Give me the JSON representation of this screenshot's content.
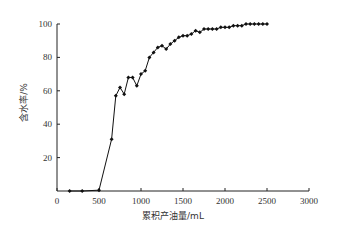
{
  "chart_data": {
    "type": "line",
    "title": "",
    "xlabel": "累积产油量/mL",
    "ylabel": "含水率/%",
    "xlim": [
      0,
      3000
    ],
    "ylim": [
      0,
      100
    ],
    "xticks": [
      0,
      500,
      1000,
      1500,
      2000,
      2500,
      3000
    ],
    "yticks": [
      20,
      40,
      60,
      80,
      100
    ],
    "grid": false,
    "legend": null,
    "marker": "diamond",
    "series": [
      {
        "name": "含水率",
        "x": [
          150,
          300,
          500,
          650,
          700,
          750,
          800,
          850,
          900,
          950,
          1000,
          1050,
          1100,
          1150,
          1200,
          1250,
          1300,
          1350,
          1400,
          1450,
          1500,
          1550,
          1600,
          1650,
          1700,
          1750,
          1800,
          1850,
          1900,
          1950,
          2000,
          2050,
          2100,
          2150,
          2200,
          2250,
          2300,
          2350,
          2400,
          2450,
          2500
        ],
        "y": [
          0,
          0,
          0.5,
          31,
          57,
          62,
          58,
          68,
          68,
          63,
          70,
          72,
          80,
          83,
          86,
          87,
          85,
          88,
          90,
          92,
          93,
          93,
          94,
          96,
          95,
          97,
          97,
          97,
          97,
          98,
          98,
          98,
          99,
          99,
          99,
          100,
          100,
          100,
          100,
          100,
          100
        ]
      }
    ]
  }
}
